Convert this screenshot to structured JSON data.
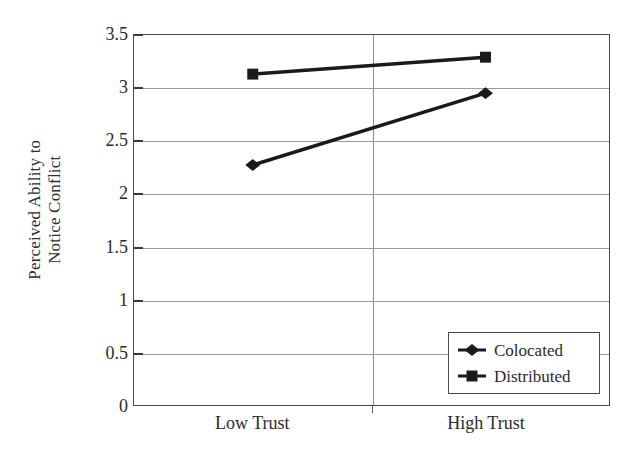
{
  "chart_data": {
    "type": "line",
    "title": "",
    "subtitle": "",
    "xlabel": "",
    "ylabel": "Perceived Ability to Notice Conflict",
    "ylabel_lines": [
      "Perceived Ability to",
      "Notice Conflict"
    ],
    "categories": [
      "Low Trust",
      "High Trust"
    ],
    "ylim": [
      0,
      3.5
    ],
    "yticks": [
      0,
      0.5,
      1,
      1.5,
      2,
      2.5,
      3,
      3.5
    ],
    "ytick_labels": [
      "0",
      "0.5",
      "1",
      "1.5",
      "2",
      "2.5",
      "3",
      "3.5"
    ],
    "grid": true,
    "grid_axis": "y",
    "legend_position": "lower-right",
    "series": [
      {
        "name": "Colocated",
        "marker": "diamond",
        "color": "#1a1a1a",
        "values": [
          2.27,
          2.95
        ]
      },
      {
        "name": "Distributed",
        "marker": "square",
        "color": "#1a1a1a",
        "values": [
          3.13,
          3.29
        ]
      }
    ],
    "annotations": []
  },
  "legend": {
    "entries": [
      {
        "label": "Colocated",
        "marker": "diamond-marker-icon"
      },
      {
        "label": "Distributed",
        "marker": "square-marker-icon"
      }
    ]
  },
  "axes": {
    "y_title_line1": "Perceived Ability to",
    "y_title_line2": "Notice Conflict"
  }
}
